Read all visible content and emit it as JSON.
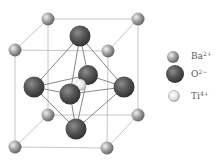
{
  "legend": [
    {
      "id": "ba",
      "symbol": "Ba",
      "charge": "2+",
      "color": "#8a8a8a"
    },
    {
      "id": "o",
      "symbol": "O",
      "charge": "2−",
      "color": "#4a4a4a"
    },
    {
      "id": "ti",
      "symbol": "Ti",
      "charge": "4+",
      "color": "#e0e0e0"
    }
  ],
  "structure": {
    "corner_ion": "Ba2+",
    "face_center_ion": "O2-",
    "body_center_ion": "Ti4+",
    "octahedron": "O2- octahedron around Ti4+"
  }
}
